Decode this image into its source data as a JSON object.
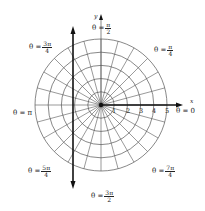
{
  "diagram": {
    "type": "polar-grid",
    "origin_px": [
      101,
      105
    ],
    "unit_px": 13.2,
    "rings": [
      1,
      2,
      3,
      4,
      5
    ],
    "ray_count": 24,
    "axis_labels": {
      "x": "x",
      "y": "y"
    },
    "radial_ticks": [
      "1",
      "2",
      "3",
      "4",
      "5"
    ],
    "angle_labels": [
      {
        "id": "theta-0",
        "prefix": "θ = 0",
        "num": "",
        "den": ""
      },
      {
        "id": "theta-pi-4",
        "prefix": "θ =",
        "num": "π",
        "den": "4"
      },
      {
        "id": "theta-pi-2",
        "prefix": "θ =",
        "num": "π",
        "den": "2"
      },
      {
        "id": "theta-3pi-4",
        "prefix": "θ =",
        "num": "3π",
        "den": "4"
      },
      {
        "id": "theta-pi",
        "prefix": "θ = π",
        "num": "",
        "den": ""
      },
      {
        "id": "theta-5pi-4",
        "prefix": "θ =",
        "num": "5π",
        "den": "4"
      },
      {
        "id": "theta-3pi-2",
        "prefix": "θ =",
        "num": "3π",
        "den": "2"
      },
      {
        "id": "theta-7pi-4",
        "prefix": "θ =",
        "num": "7π",
        "den": "4"
      }
    ],
    "vertical_line": {
      "x_px": 73,
      "description": "bold vertical line with arrows at both ends"
    },
    "colors": {
      "line": "#555555",
      "bold": "#111111",
      "background": "#ffffff"
    }
  }
}
